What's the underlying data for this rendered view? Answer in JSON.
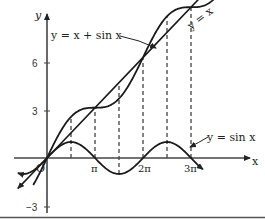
{
  "chart_data": {
    "type": "line",
    "title": "",
    "xlabel": "x",
    "ylabel": "y",
    "origin_label": "O",
    "x_ticks": [
      {
        "value": 3.14159,
        "label": "π"
      },
      {
        "value": 6.28318,
        "label": "2π"
      },
      {
        "value": 9.42478,
        "label": "3π"
      }
    ],
    "y_ticks": [
      {
        "value": 6,
        "label": "6"
      },
      {
        "value": 3,
        "label": "3"
      },
      {
        "value": -3,
        "label": "-3"
      }
    ],
    "xlim": [
      -2.1,
      13.2
    ],
    "ylim": [
      -3.4,
      9.0
    ],
    "grid": false,
    "dashed_guides_at_x": [
      1.5708,
      3.14159,
      4.7124,
      6.28318,
      7.854,
      9.42478
    ],
    "series": [
      {
        "name": "y = x",
        "label": "y = x",
        "expr": "x",
        "x_range": [
          -2.0,
          12.3
        ]
      },
      {
        "name": "y = x + sin x",
        "label": "y = x + sin x",
        "expr": "x + sin(x)",
        "x_range": [
          -2.0,
          12.3
        ]
      },
      {
        "name": "y = sin x",
        "label": "y = sin x",
        "expr": "sin(x)",
        "x_range": [
          -2.0,
          12.3
        ]
      }
    ],
    "annotations": [
      {
        "text": "y = x + sin x",
        "points_to": "y = x + sin x curve near x ≈ 7.2"
      },
      {
        "text": "y = x",
        "position": "upper right along line"
      },
      {
        "text": "y = sin x",
        "points_to": "sine curve near x ≈ 8.8"
      }
    ]
  },
  "labels": {
    "y_axis": "y",
    "x_axis": "x",
    "origin": "O",
    "tick_6": "6",
    "tick_3": "3",
    "tick_neg3": "−3",
    "tick_pi": "π",
    "tick_2pi": "2π",
    "tick_3pi": "3π",
    "curve_sum": "y = x + sin x",
    "curve_identity": "y = x",
    "curve_sin": "y = sin x"
  }
}
